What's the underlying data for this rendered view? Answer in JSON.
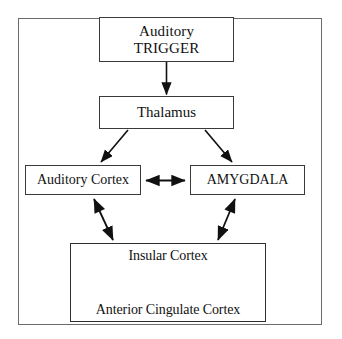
{
  "diagram": {
    "frame": {
      "border_color": "#6b6b6b"
    },
    "nodes": {
      "trigger": {
        "line1": "Auditory",
        "line2": "TRIGGER"
      },
      "thalamus": {
        "label": "Thalamus"
      },
      "auditory_cortex": {
        "label": "Auditory Cortex"
      },
      "amygdala": {
        "label": "AMYGDALA"
      },
      "insular_cortex": {
        "label": "Insular Cortex"
      },
      "anterior_cingulate_cortex": {
        "label": "Anterior Cingulate Cortex"
      }
    },
    "connectors": [
      {
        "name": "trigger-to-thalamus",
        "from": "trigger",
        "to": "thalamus",
        "style": "single-arrow",
        "direction": "down"
      },
      {
        "name": "thalamus-to-auditory-cortex",
        "from": "thalamus",
        "to": "auditory_cortex",
        "style": "single-arrow",
        "direction": "down-left"
      },
      {
        "name": "thalamus-to-amygdala",
        "from": "thalamus",
        "to": "amygdala",
        "style": "single-arrow",
        "direction": "down-right"
      },
      {
        "name": "auditory-cortex-to-amygdala",
        "from": "auditory_cortex",
        "to": "amygdala",
        "style": "double-arrow",
        "direction": "horizontal"
      },
      {
        "name": "auditory-cortex-to-insular-cortex",
        "from": "auditory_cortex",
        "to": "insular_cortex",
        "style": "double-arrow",
        "direction": "diagonal"
      },
      {
        "name": "amygdala-to-insular-cortex",
        "from": "amygdala",
        "to": "insular_cortex",
        "style": "double-arrow",
        "direction": "diagonal"
      },
      {
        "name": "insular-to-anterior-cingulate",
        "from": "insular_cortex",
        "to": "anterior_cingulate_cortex",
        "style": "double-arrow",
        "direction": "vertical"
      }
    ],
    "colors": {
      "stroke": "#111111",
      "box_border": "#3a3a3a",
      "frame_border": "#6b6b6b",
      "background": "#ffffff",
      "text": "#111111"
    }
  }
}
